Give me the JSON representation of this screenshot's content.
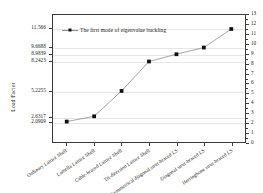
{
  "chart_data": {
    "type": "line",
    "title": "",
    "xlabel": "",
    "ylabel": "Load Factor",
    "grid": true,
    "legend_position": "top-left",
    "categories": [
      "Ordinary Lattice Shell",
      "Lamella Lattice Shell",
      "Cable-braced Lattice Shell",
      "Tri-direction Lattice Shell",
      "Symmetrical diagonal strut-braced LS",
      "Diagonal strut-braced LS",
      "Herringbone strut-braced LS"
    ],
    "series": [
      {
        "name": "The first mode of eigenvalue buckling",
        "values": [
          2.0909,
          2.6317,
          5.2255,
          8.2423,
          8.9839,
          9.6688,
          11.566
        ]
      }
    ],
    "left_axis": {
      "tick_labels": [
        "11.566",
        "9.6688",
        "8.9839",
        "8.2423",
        "5.2255",
        "2.6317",
        "2.0909"
      ],
      "tick_values": [
        11.566,
        9.6688,
        8.9839,
        8.2423,
        5.2255,
        2.6317,
        2.0909
      ]
    },
    "right_axis": {
      "ylim": [
        0,
        13
      ],
      "tick_labels": [
        "0",
        "1",
        "2",
        "3",
        "4",
        "5",
        "6",
        "7",
        "8",
        "9",
        "10",
        "11",
        "12",
        "13"
      ],
      "tick_values": [
        0,
        1,
        2,
        3,
        4,
        5,
        6,
        7,
        8,
        9,
        10,
        11,
        12,
        13
      ]
    },
    "colors": {
      "line": "#8a8a8a",
      "marker": "#111111",
      "axis": "#3b3b3b",
      "grid": "#e6e6e6",
      "background": "#ffffff"
    }
  },
  "legend": {
    "entries": [
      {
        "label": "The first mode of eigenvalue buckling",
        "marker": "filled-square",
        "icon": "legend-line-marker-icon"
      }
    ]
  }
}
